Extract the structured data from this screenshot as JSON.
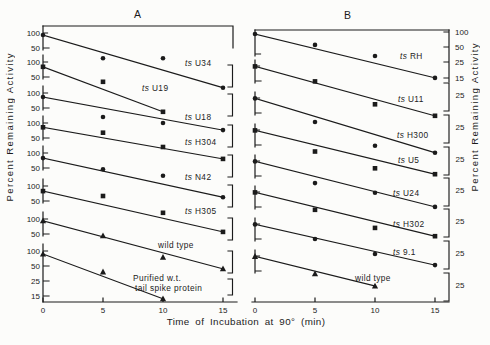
{
  "figure": {
    "panel_a_label": "A",
    "panel_b_label": "B",
    "x_axis_label": "Time of Incubation at 90° (min)",
    "y_axis_label_left": "Percent Remaining Activity",
    "y_axis_label_right": "Percent Remaining Activity",
    "ink_color": "#1b1b1b",
    "background_color": "#fcfcfa"
  },
  "chart_data": [
    {
      "panel": "A",
      "type": "line",
      "xlabel": "Time of Incubation at 90° (min)",
      "ylabel": "Percent Remaining Activity",
      "yscale": "log",
      "x_ticks": [
        0,
        5,
        10,
        15
      ],
      "layout_note": "eight staggered sub-plots, each with its own ordinate segment",
      "series": [
        {
          "name": "ts U34",
          "marker": "circle",
          "x": [
            0,
            5,
            10,
            15
          ],
          "y": [
            91,
            31,
            31,
            8
          ],
          "yticks": [
            100,
            50
          ]
        },
        {
          "name": "ts U19",
          "marker": "square",
          "x": [
            0,
            5,
            10
          ],
          "y": [
            80,
            40,
            10
          ],
          "yticks": [
            100,
            50
          ]
        },
        {
          "name": "ts U18",
          "marker": "circle",
          "x": [
            0,
            5,
            10,
            15
          ],
          "y": [
            83,
            33,
            25,
            18
          ],
          "yticks": [
            100,
            50
          ]
        },
        {
          "name": "ts H304",
          "marker": "square",
          "x": [
            0,
            5,
            10,
            15
          ],
          "y": [
            82,
            64,
            33,
            19
          ],
          "yticks": [
            100,
            50
          ]
        },
        {
          "name": "ts N42",
          "marker": "circle",
          "x": [
            0,
            5,
            10,
            15
          ],
          "y": [
            79,
            47,
            35,
            13
          ],
          "yticks": [
            100,
            50
          ]
        },
        {
          "name": "ts H305",
          "marker": "square",
          "x": [
            0,
            5,
            10,
            15
          ],
          "y": [
            79,
            63,
            29,
            12
          ],
          "yticks": [
            100,
            50
          ]
        },
        {
          "name": "wild type",
          "marker": "triangle",
          "x": [
            0,
            5,
            10,
            15
          ],
          "y": [
            92,
            46,
            17,
            10
          ],
          "yticks": [
            100,
            50
          ]
        },
        {
          "name": "Purified w.t.\ntail spike protein",
          "marker": "triangle",
          "x": [
            0,
            5,
            10
          ],
          "y": [
            87,
            38,
            11
          ],
          "yticks": [
            100,
            50,
            25,
            15
          ]
        }
      ]
    },
    {
      "panel": "B",
      "type": "line",
      "xlabel": "Time of Incubation at 90° (min)",
      "ylabel": "Percent Remaining Activity",
      "yscale": "log",
      "x_ticks": [
        0,
        5,
        10,
        15
      ],
      "layout_note": "eight staggered sub-plots, ordinate tick labels on right side",
      "series": [
        {
          "name": "ts RH",
          "marker": "circle",
          "x": [
            0,
            5,
            10,
            15
          ],
          "y": [
            91,
            55,
            33,
            12
          ],
          "yticks": [
            100,
            50,
            25,
            15
          ]
        },
        {
          "name": "ts U11",
          "marker": "square",
          "x": [
            0,
            5,
            10,
            15
          ],
          "y": [
            98,
            49,
            17,
            10
          ],
          "yticks": [
            25
          ]
        },
        {
          "name": "ts H300",
          "marker": "circle",
          "x": [
            0,
            5,
            10,
            15
          ],
          "y": [
            98,
            33,
            11,
            8
          ],
          "yticks": [
            25
          ]
        },
        {
          "name": "ts U5",
          "marker": "square",
          "x": [
            0,
            5,
            10,
            15
          ],
          "y": [
            98,
            37,
            17,
            13
          ],
          "yticks": [
            25
          ]
        },
        {
          "name": "ts U24",
          "marker": "circle",
          "x": [
            0,
            5,
            10,
            15
          ],
          "y": [
            98,
            36,
            23,
            12
          ],
          "yticks": [
            25
          ]
        },
        {
          "name": "ts H302",
          "marker": "square",
          "x": [
            0,
            5,
            10,
            15
          ],
          "y": [
            98,
            44,
            19,
            13
          ],
          "yticks": [
            25
          ]
        },
        {
          "name": "ts 9.1",
          "marker": "circle",
          "x": [
            0,
            5,
            10,
            15
          ],
          "y": [
            98,
            50,
            25,
            15
          ],
          "yticks": [
            25
          ]
        },
        {
          "name": "wild type",
          "marker": "triangle",
          "x": [
            0,
            5,
            10
          ],
          "y": [
            98,
            44,
            25
          ],
          "yticks": [
            25
          ]
        }
      ]
    }
  ]
}
